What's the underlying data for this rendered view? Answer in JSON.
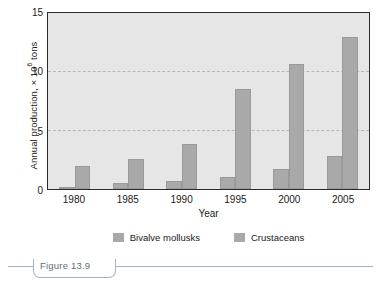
{
  "figure": {
    "caption": "Figure 13.9"
  },
  "chart_data": {
    "type": "bar",
    "title": "",
    "xlabel": "Year",
    "ylabel": "Annual production, × 10⁶ tons",
    "ylabel_prefix": "Annual production, × 10",
    "ylabel_exponent": "6",
    "ylabel_suffix": " tons",
    "categories": [
      "1980",
      "1985",
      "1990",
      "1995",
      "2000",
      "2005"
    ],
    "series": [
      {
        "name": "Bivalve mollusks",
        "values": [
          0.2,
          0.5,
          0.65,
          1.0,
          1.7,
          2.8
        ],
        "color": "#a9a9a9"
      },
      {
        "name": "Crustaceans",
        "values": [
          1.9,
          2.5,
          3.8,
          8.4,
          10.5,
          12.8
        ],
        "color": "#a9a9a9"
      }
    ],
    "ylim": [
      0,
      15
    ],
    "yticks": [
      0,
      5,
      10,
      15
    ],
    "ytick_labels": [
      "0",
      "5",
      "10",
      "15"
    ],
    "gridlines": [
      5,
      10
    ],
    "grid": true,
    "legend_position": "bottom",
    "plot_background": "#e6e6e6",
    "axis_color": "#2b2b2b",
    "gridline_color": "#b9b9b9"
  },
  "legend": {
    "items": [
      {
        "label": "Bivalve mollusks"
      },
      {
        "label": "Crustaceans"
      }
    ]
  }
}
